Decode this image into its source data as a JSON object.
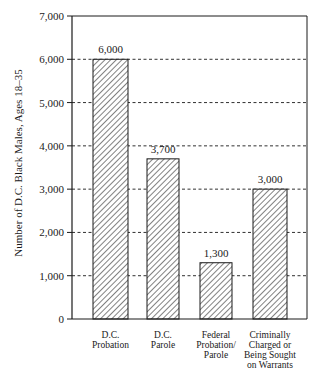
{
  "chart_data": {
    "type": "bar",
    "title": "",
    "xlabel": "",
    "ylabel": "Number of D.C. Black Males, Ages 18–35",
    "ylim": [
      0,
      7000
    ],
    "yticks": [
      0,
      1000,
      2000,
      3000,
      4000,
      5000,
      6000,
      7000
    ],
    "ytick_labels": [
      "0",
      "1,000",
      "2,000",
      "3,000",
      "4,000",
      "5,000",
      "6,000",
      "7,000"
    ],
    "grid": "horizontal dashed",
    "categories": [
      [
        "D.C.",
        "Probation"
      ],
      [
        "D.C.",
        "Parole"
      ],
      [
        "Federal",
        "Probation/",
        "Parole"
      ],
      [
        "Criminally",
        "Charged or",
        "Being Sought",
        "on Warrants"
      ]
    ],
    "values": [
      6000,
      3700,
      1300,
      3000
    ],
    "value_labels": [
      "6,000",
      "3,700",
      "1,300",
      "3,000"
    ],
    "bar_fill": "diagonal hatch",
    "colors": {
      "ink": "#1a1a1a",
      "background": "#ffffff"
    }
  }
}
